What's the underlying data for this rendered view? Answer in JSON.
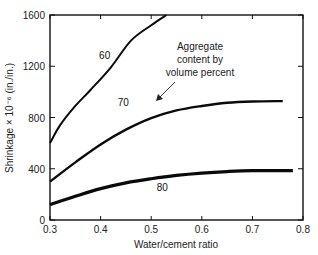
{
  "chart_data": {
    "type": "line",
    "title": "",
    "xlabel": "Water/cement ratio",
    "ylabel": "Shrinkage × 10⁻⁶ (in./in.)",
    "xlim": [
      0.3,
      0.8
    ],
    "ylim": [
      0,
      1600
    ],
    "xticks": [
      0.3,
      0.4,
      0.5,
      0.6,
      0.7,
      0.8
    ],
    "xtick_labels": [
      "0.3",
      "0.4",
      "0.5",
      "0.6",
      "0.7",
      "0.8"
    ],
    "yticks": [
      0,
      400,
      800,
      1200,
      1600
    ],
    "ytick_labels": [
      "0",
      "400",
      "800",
      "1200",
      "1600"
    ],
    "grid": false,
    "legend": "none",
    "annotation": {
      "lines": [
        "Aggregate",
        "content by",
        "volume percent"
      ],
      "points_to": "70"
    },
    "series": [
      {
        "name": "60",
        "x": [
          0.3,
          0.32,
          0.35,
          0.38,
          0.42,
          0.46,
          0.5,
          0.53
        ],
        "y": [
          600,
          740,
          890,
          1015,
          1190,
          1400,
          1520,
          1600
        ]
      },
      {
        "name": "70",
        "x": [
          0.3,
          0.35,
          0.4,
          0.45,
          0.5,
          0.55,
          0.6,
          0.65,
          0.7,
          0.76
        ],
        "y": [
          300,
          450,
          590,
          705,
          795,
          855,
          890,
          915,
          925,
          928
        ]
      },
      {
        "name": "80",
        "x": [
          0.3,
          0.35,
          0.4,
          0.45,
          0.5,
          0.55,
          0.6,
          0.65,
          0.7,
          0.78
        ],
        "y": [
          120,
          185,
          245,
          290,
          322,
          348,
          366,
          378,
          385,
          386
        ]
      }
    ]
  }
}
